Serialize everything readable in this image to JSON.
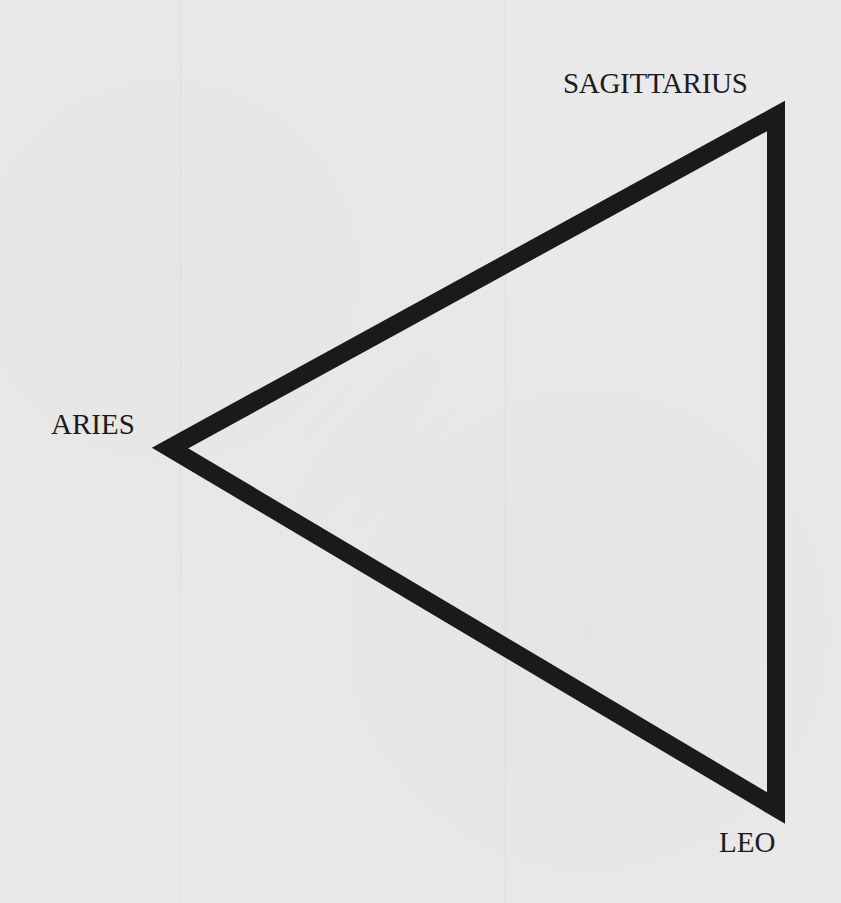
{
  "diagram": {
    "type": "triangle",
    "vertices": [
      {
        "id": "sagittarius",
        "label": "SAGITTARIUS",
        "position": "top-right"
      },
      {
        "id": "aries",
        "label": "ARIES",
        "position": "left"
      },
      {
        "id": "leo",
        "label": "LEO",
        "position": "bottom-right"
      }
    ],
    "edges": [
      {
        "from": "aries",
        "to": "sagittarius"
      },
      {
        "from": "sagittarius",
        "to": "leo"
      },
      {
        "from": "leo",
        "to": "aries"
      }
    ],
    "colors": {
      "stroke": "#1a1a1a",
      "text": "#1c1c1c",
      "paper": "#e9e9e9"
    }
  },
  "labels": {
    "sagittarius": "SAGITTARIUS",
    "aries": "ARIES",
    "leo": "LEO"
  }
}
